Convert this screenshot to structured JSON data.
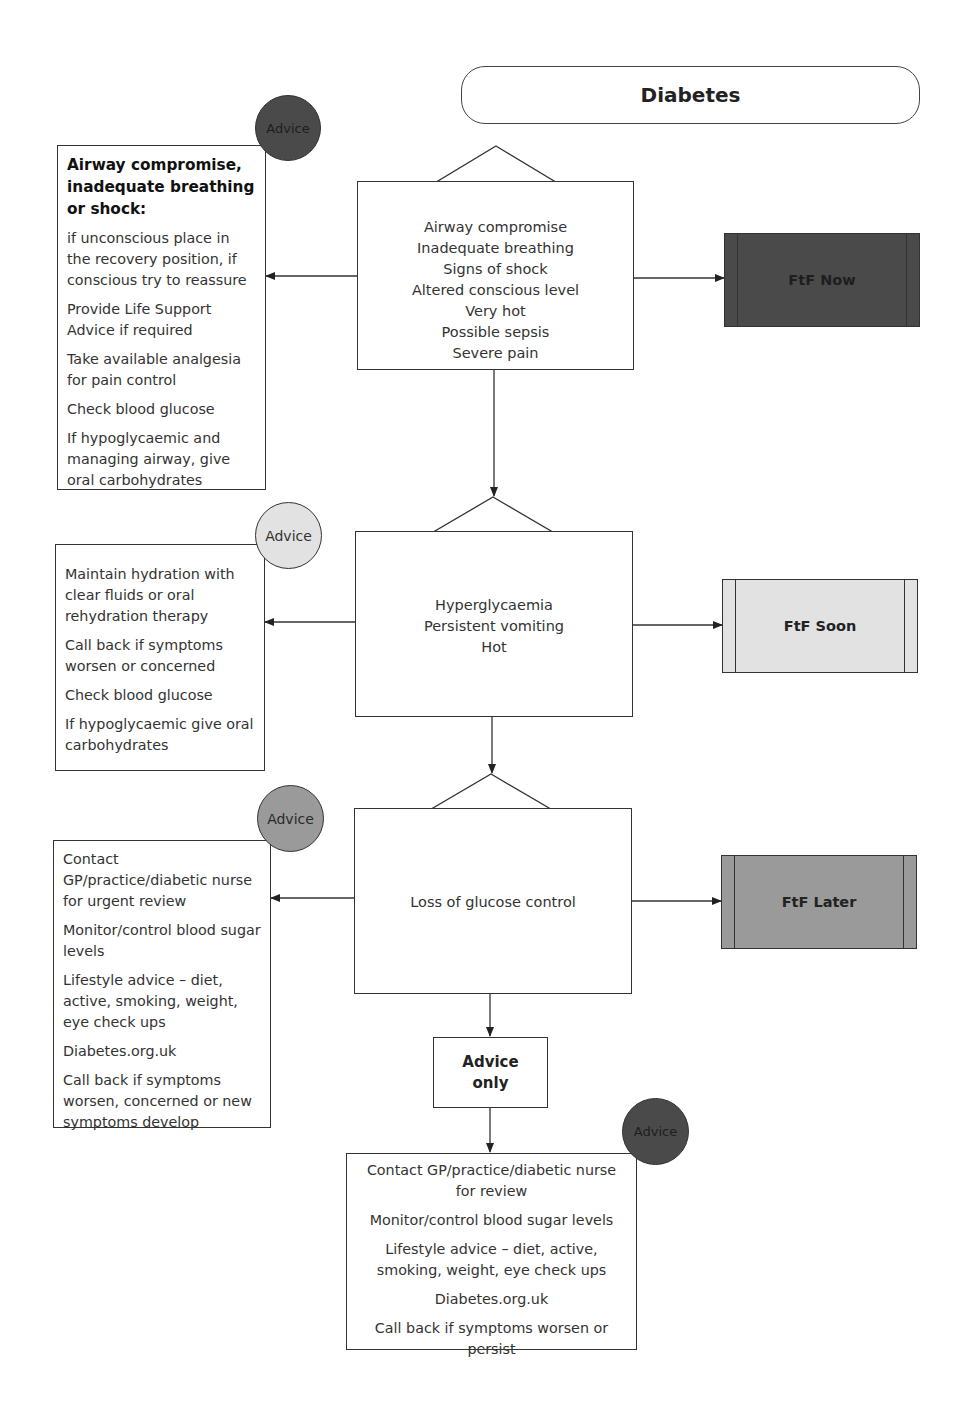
{
  "title": "Diabetes",
  "colors": {
    "dark": "#4a4a4a",
    "light": "#e2e2e2",
    "medium": "#9a9a9a",
    "line": "#333333",
    "white": "#ffffff"
  },
  "levels": [
    {
      "criteria": [
        "Airway compromise",
        "Inadequate breathing",
        "Signs of shock",
        "Altered conscious level",
        "Very hot",
        "Possible sepsis",
        "Severe pain"
      ],
      "outcome": "FtF Now",
      "advice_badge": "Advice",
      "advice_heading": "Airway compromise, inadequate breathing or shock:",
      "advice_items": [
        "if unconscious place in the recovery position, if conscious try to reassure",
        "Provide Life Support Advice if required",
        "Take available analgesia for pain control",
        "Check blood glucose",
        "If hypoglycaemic and managing airway, give oral carbohydrates"
      ]
    },
    {
      "criteria": [
        "Hyperglycaemia",
        "Persistent vomiting",
        "Hot"
      ],
      "outcome": "FtF Soon",
      "advice_badge": "Advice",
      "advice_items": [
        "Maintain hydration with clear fluids or oral rehydration  therapy",
        "Call back if symptoms worsen or concerned",
        "Check blood glucose",
        "If hypoglycaemic give oral carbohydrates"
      ]
    },
    {
      "criteria": [
        "Loss of glucose control"
      ],
      "outcome": "FtF Later",
      "advice_badge": "Advice",
      "advice_items": [
        "Contact GP/practice/diabetic nurse for urgent review",
        "Monitor/control blood sugar levels",
        "Lifestyle advice – diet, active, smoking, weight, eye check ups",
        "Diabetes.org.uk",
        "Call back if symptoms worsen, concerned or new symptoms develop"
      ]
    }
  ],
  "advice_only": {
    "label": "Advice only",
    "badge": "Advice",
    "items": [
      "Contact GP/practice/diabetic nurse for review",
      "Monitor/control blood sugar levels",
      "Lifestyle advice – diet, active, smoking, weight, eye check ups",
      "Diabetes.org.uk",
      "Call back if symptoms worsen or persist"
    ]
  }
}
